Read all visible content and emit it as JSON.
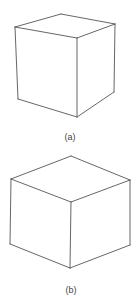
{
  "figure": {
    "panels": [
      {
        "id": "a",
        "label": "(a)",
        "description": "Cube drawn in oblique/perspective view, front face seen at an angle",
        "vertices": {
          "top_left": [
            15,
            27
          ],
          "top_back": [
            61,
            14
          ],
          "top_right": [
            115,
            24
          ],
          "top_front": [
            77,
            38
          ],
          "bottom_left": [
            18,
            99
          ],
          "bottom_front": [
            77,
            117
          ],
          "bottom_right": [
            114,
            92
          ]
        },
        "label_position": [
          70,
          133
        ]
      },
      {
        "id": "b",
        "label": "(b)",
        "description": "Cube drawn in isometric view",
        "vertices": {
          "top_left": [
            11,
            179
          ],
          "top_back": [
            71,
            156
          ],
          "top_right": [
            130,
            180
          ],
          "top_front": [
            71,
            202
          ],
          "bottom_left": [
            10,
            244
          ],
          "bottom_front": [
            70,
            268
          ],
          "bottom_right": [
            130,
            245
          ]
        },
        "label_position": [
          71,
          286
        ]
      }
    ],
    "line_color": "#555555",
    "background": "#ffffff"
  }
}
